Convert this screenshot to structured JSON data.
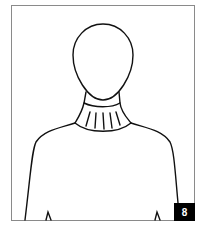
{
  "illustration": {
    "subject": "mannequin-turtleneck-sweater",
    "stroke_color": "#111111",
    "frame_color": "#8a8a8a"
  },
  "badge": {
    "label": "8",
    "background": "#000000",
    "color": "#ffffff"
  }
}
